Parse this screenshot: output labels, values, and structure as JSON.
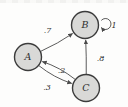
{
  "diagram": {
    "type": "state-transition-diagram",
    "nodes": [
      {
        "id": "A",
        "label": "A",
        "x": 28,
        "y": 57,
        "r": 13.5
      },
      {
        "id": "B",
        "label": "B",
        "x": 85,
        "y": 25,
        "r": 13.5
      },
      {
        "id": "C",
        "label": "C",
        "x": 86,
        "y": 88,
        "r": 13.5
      }
    ],
    "edges": [
      {
        "from": "A",
        "to": "B",
        "label": ".7",
        "bulge": 3,
        "label_x": 47.5,
        "label_y": 33
      },
      {
        "from": "B",
        "to": "B",
        "label": "1",
        "loop": {
          "ox": 20.5,
          "oy": -1,
          "r": 5.5
        },
        "label_x": 114,
        "label_y": 28
      },
      {
        "from": "C",
        "to": "B",
        "label": ".8",
        "bulge": 1,
        "label_x": 100.5,
        "label_y": 61
      },
      {
        "from": "C",
        "to": "A",
        "label": ".2",
        "bulge": 6,
        "label_x": 61.5,
        "label_y": 73
      },
      {
        "from": "A",
        "to": "C",
        "label": ".3",
        "bulge": 6,
        "label_x": 47,
        "label_y": 89.5
      }
    ],
    "colors": {
      "node_fill": "#d9d9d7",
      "node_stroke": "#3c3c3c",
      "edge": "#4a4a4a",
      "text": "#2e2e2e",
      "background": "#fdfdfc"
    }
  }
}
